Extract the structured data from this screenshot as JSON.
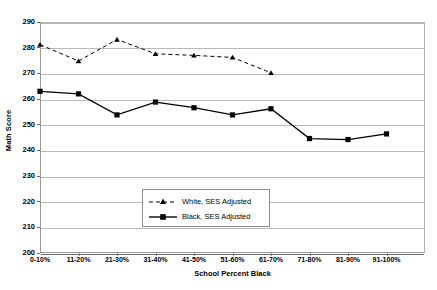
{
  "chart_data": {
    "type": "line",
    "title": "",
    "xlabel": "School Percent Black",
    "ylabel": "Math Score",
    "ylim": [
      200,
      290
    ],
    "ytick_step": 10,
    "yticks": [
      290,
      280,
      270,
      260,
      250,
      240,
      230,
      220,
      210,
      200
    ],
    "grid": true,
    "legend_position": "inside-bottom-center",
    "categories": [
      "0-10%",
      "11-20%",
      "21-30%",
      "31-40%",
      "41-50%",
      "51-60%",
      "61-70%",
      "71-80%",
      "81-90%",
      "91-100%"
    ],
    "series": [
      {
        "name": "White, SES Adjusted",
        "style": "dashed",
        "marker": "triangle",
        "color": "#000000",
        "values": [
          281.2,
          274.8,
          283.2,
          277.6,
          277.0,
          276.2,
          270.2,
          null,
          null,
          null
        ]
      },
      {
        "name": "Black, SES Adjusted",
        "style": "solid",
        "marker": "square",
        "color": "#000000",
        "values": [
          263.0,
          262.0,
          253.8,
          258.8,
          256.6,
          253.8,
          256.2,
          244.6,
          244.2,
          246.4
        ]
      }
    ]
  },
  "legend": {
    "entries": [
      {
        "label": "White, SES Adjusted"
      },
      {
        "label": "Black, SES Adjusted"
      }
    ]
  },
  "axes": {
    "y_title": "Math Score",
    "x_title": "School Percent Black"
  },
  "colors": {
    "background": "#ffffff",
    "gridline": "#b9b9b9",
    "axis": "#6a6a6a",
    "series": "#000000"
  }
}
